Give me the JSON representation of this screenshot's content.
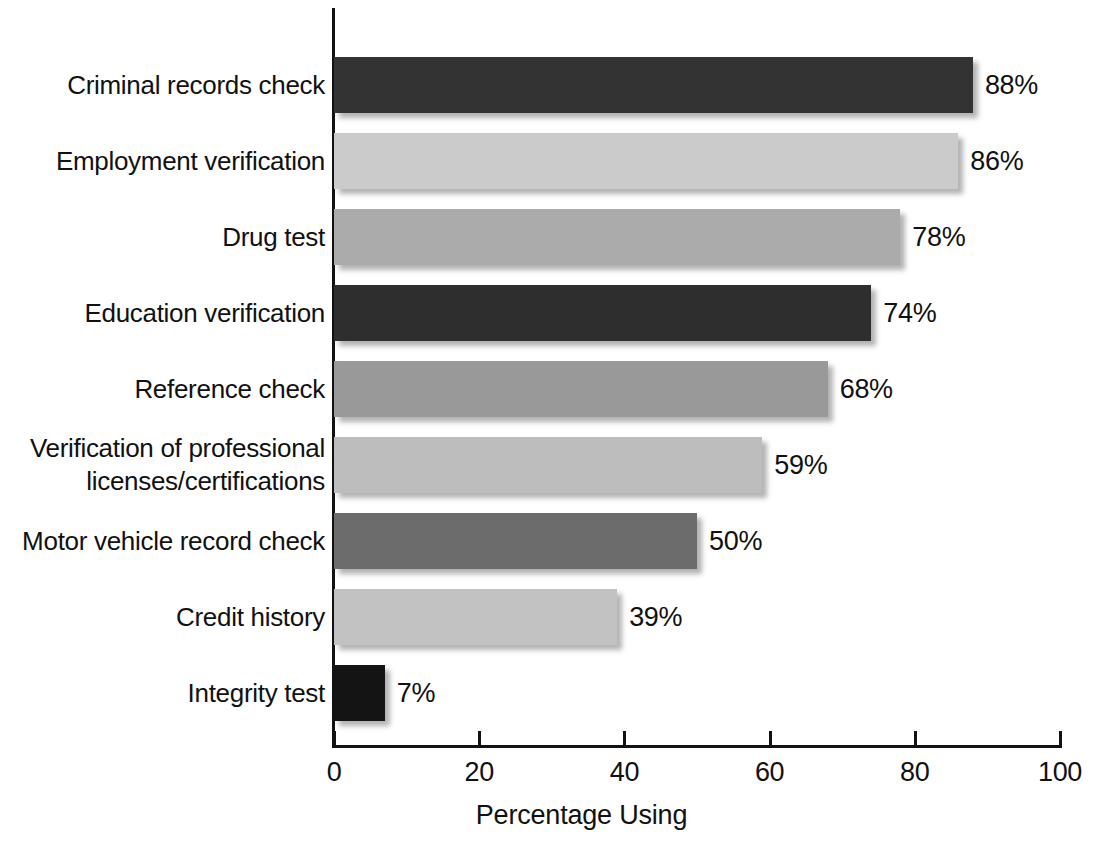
{
  "chart_data": {
    "type": "bar",
    "orientation": "horizontal",
    "title": "",
    "xlabel": "Percentage Using",
    "ylabel": "",
    "xlim": [
      0,
      100
    ],
    "xticks": [
      "0",
      "20",
      "40",
      "60",
      "80",
      "100"
    ],
    "grid": false,
    "legend": "none",
    "categories": [
      "Criminal records check",
      "Employment verification",
      "Drug test",
      "Education verification",
      "Reference check",
      "Verification of professional\nlicenses/certifications",
      "Motor vehicle record check",
      "Credit history",
      "Integrity test"
    ],
    "values": [
      88,
      86,
      78,
      74,
      68,
      59,
      50,
      39,
      7
    ],
    "value_labels": [
      "88%",
      "86%",
      "78%",
      "74%",
      "68%",
      "59%",
      "50%",
      "39%",
      "7%"
    ],
    "bar_colors": [
      "#333333",
      "#cbcbcb",
      "#ababab",
      "#2e2e2e",
      "#999999",
      "#bdbdbd",
      "#6c6c6c",
      "#c2c2c2",
      "#141414"
    ],
    "axis_color": "#121212",
    "background_color": "#ffffff"
  }
}
